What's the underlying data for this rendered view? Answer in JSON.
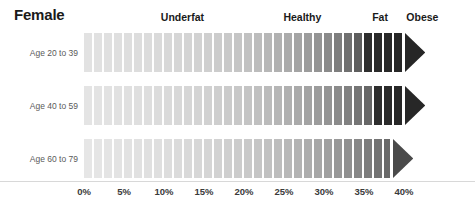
{
  "title": "Female",
  "categories": [
    {
      "label": "Underfat",
      "center_pct": 12.3
    },
    {
      "label": "Healthy",
      "center_pct": 27.3
    },
    {
      "label": "Fat",
      "center_pct": 37.0
    },
    {
      "label": "Obese",
      "center_pct": 42.3
    }
  ],
  "axis": {
    "ticks": [
      "0%",
      "5%",
      "10%",
      "15%",
      "20%",
      "25%",
      "30%",
      "35%",
      "40%"
    ],
    "tick_values": [
      0,
      5,
      10,
      15,
      20,
      25,
      30,
      35,
      40
    ],
    "min": 0,
    "max": 40,
    "px_per_pct": 8.0,
    "origin_x": 84
  },
  "rows": [
    {
      "label": "Age 20 to 39",
      "top": 33,
      "height": 39,
      "end_pct": 40.0
    },
    {
      "label": "Age 40 to 59",
      "top": 86,
      "height": 39,
      "end_pct": 40.0
    },
    {
      "label": "Age 60 to 79",
      "top": 139,
      "height": 39,
      "end_pct": 38.5
    }
  ],
  "colors": {
    "text_dark": "#1a1a1a",
    "text_muted": "#5a5a5a",
    "tick": "#3a3a3a",
    "background": "#ffffff",
    "gap": "#ffffff",
    "baseline": "#d8d8d8"
  },
  "chart_data": {
    "type": "bar",
    "title": "Female",
    "xlabel": "Body fat percentage",
    "ylabel": "",
    "xlim": [
      0,
      44
    ],
    "grid": false,
    "legend": "top",
    "categories": [
      "Age 20 to 39",
      "Age 40 to 59",
      "Age 60 to 79"
    ],
    "tick_labels": [
      "0%",
      "5%",
      "10%",
      "15%",
      "20%",
      "25%",
      "30%",
      "35%",
      "40%"
    ],
    "zone_labels": [
      "Underfat",
      "Healthy",
      "Fat",
      "Obese"
    ],
    "series": [
      {
        "name": "Age 20 to 39",
        "end_value": 40.0,
        "segments": [
          {
            "start": 0.0,
            "end": 1.25,
            "color": "#e2e2e2"
          },
          {
            "start": 1.25,
            "end": 2.5,
            "color": "#e1e1e1"
          },
          {
            "start": 2.5,
            "end": 3.75,
            "color": "#e0e0e0"
          },
          {
            "start": 3.75,
            "end": 5.0,
            "color": "#dfdfdf"
          },
          {
            "start": 5.0,
            "end": 6.25,
            "color": "#dedede"
          },
          {
            "start": 6.25,
            "end": 7.5,
            "color": "#dddddd"
          },
          {
            "start": 7.5,
            "end": 8.75,
            "color": "#dcdcdc"
          },
          {
            "start": 8.75,
            "end": 10.0,
            "color": "#dadada"
          },
          {
            "start": 10.0,
            "end": 11.25,
            "color": "#d8d8d8"
          },
          {
            "start": 11.25,
            "end": 12.5,
            "color": "#d6d6d6"
          },
          {
            "start": 12.5,
            "end": 13.75,
            "color": "#d4d4d4"
          },
          {
            "start": 13.75,
            "end": 15.0,
            "color": "#d2d2d2"
          },
          {
            "start": 15.0,
            "end": 16.25,
            "color": "#cfcfcf"
          },
          {
            "start": 16.25,
            "end": 17.5,
            "color": "#cccccc"
          },
          {
            "start": 17.5,
            "end": 18.75,
            "color": "#c9c9c9"
          },
          {
            "start": 18.75,
            "end": 20.0,
            "color": "#c5c5c5"
          },
          {
            "start": 20.0,
            "end": 21.25,
            "color": "#c1c1c1"
          },
          {
            "start": 21.25,
            "end": 22.5,
            "color": "#bcbcbc"
          },
          {
            "start": 22.5,
            "end": 23.75,
            "color": "#b7b7b7"
          },
          {
            "start": 23.75,
            "end": 25.0,
            "color": "#b1b1b1"
          },
          {
            "start": 25.0,
            "end": 26.25,
            "color": "#ababab"
          },
          {
            "start": 26.25,
            "end": 27.5,
            "color": "#a4a4a4"
          },
          {
            "start": 27.5,
            "end": 28.75,
            "color": "#9c9c9c"
          },
          {
            "start": 28.75,
            "end": 30.0,
            "color": "#949494"
          },
          {
            "start": 30.0,
            "end": 31.25,
            "color": "#8a8a8a"
          },
          {
            "start": 31.25,
            "end": 32.5,
            "color": "#7e7e7e"
          },
          {
            "start": 32.5,
            "end": 33.75,
            "color": "#707070"
          },
          {
            "start": 33.75,
            "end": 35.0,
            "color": "#5e5e5e"
          },
          {
            "start": 35.0,
            "end": 36.25,
            "color": "#2e2e2e"
          },
          {
            "start": 36.25,
            "end": 37.5,
            "color": "#2a2a2a"
          },
          {
            "start": 37.5,
            "end": 38.75,
            "color": "#282828"
          },
          {
            "start": 38.75,
            "end": 40.0,
            "color": "#262626"
          }
        ],
        "arrow_color": "#262626"
      },
      {
        "name": "Age 40 to 59",
        "end_value": 40.0,
        "segments": [
          {
            "start": 0.0,
            "end": 1.25,
            "color": "#e4e4e4"
          },
          {
            "start": 1.25,
            "end": 2.5,
            "color": "#e3e3e3"
          },
          {
            "start": 2.5,
            "end": 3.75,
            "color": "#e2e2e2"
          },
          {
            "start": 3.75,
            "end": 5.0,
            "color": "#e1e1e1"
          },
          {
            "start": 5.0,
            "end": 6.25,
            "color": "#e0e0e0"
          },
          {
            "start": 6.25,
            "end": 7.5,
            "color": "#dfdfdf"
          },
          {
            "start": 7.5,
            "end": 8.75,
            "color": "#dedede"
          },
          {
            "start": 8.75,
            "end": 10.0,
            "color": "#dcdcdc"
          },
          {
            "start": 10.0,
            "end": 11.25,
            "color": "#dadada"
          },
          {
            "start": 11.25,
            "end": 12.5,
            "color": "#d8d8d8"
          },
          {
            "start": 12.5,
            "end": 13.75,
            "color": "#d6d6d6"
          },
          {
            "start": 13.75,
            "end": 15.0,
            "color": "#d4d4d4"
          },
          {
            "start": 15.0,
            "end": 16.25,
            "color": "#d1d1d1"
          },
          {
            "start": 16.25,
            "end": 17.5,
            "color": "#cecece"
          },
          {
            "start": 17.5,
            "end": 18.75,
            "color": "#cbcbcb"
          },
          {
            "start": 18.75,
            "end": 20.0,
            "color": "#c8c8c8"
          },
          {
            "start": 20.0,
            "end": 21.25,
            "color": "#c4c4c4"
          },
          {
            "start": 21.25,
            "end": 22.5,
            "color": "#c0c0c0"
          },
          {
            "start": 22.5,
            "end": 23.75,
            "color": "#bbbbbb"
          },
          {
            "start": 23.75,
            "end": 25.0,
            "color": "#b6b6b6"
          },
          {
            "start": 25.0,
            "end": 26.25,
            "color": "#b0b0b0"
          },
          {
            "start": 26.25,
            "end": 27.5,
            "color": "#aaaaaa"
          },
          {
            "start": 27.5,
            "end": 28.75,
            "color": "#a3a3a3"
          },
          {
            "start": 28.75,
            "end": 30.0,
            "color": "#9c9c9c"
          },
          {
            "start": 30.0,
            "end": 31.25,
            "color": "#949494"
          },
          {
            "start": 31.25,
            "end": 32.5,
            "color": "#8b8b8b"
          },
          {
            "start": 32.5,
            "end": 33.75,
            "color": "#818181"
          },
          {
            "start": 33.75,
            "end": 35.0,
            "color": "#757575"
          },
          {
            "start": 35.0,
            "end": 36.25,
            "color": "#676767"
          },
          {
            "start": 36.25,
            "end": 37.5,
            "color": "#2e2e2e"
          },
          {
            "start": 37.5,
            "end": 38.75,
            "color": "#2a2a2a"
          },
          {
            "start": 38.75,
            "end": 40.0,
            "color": "#272727"
          }
        ],
        "arrow_color": "#272727"
      },
      {
        "name": "Age 60 to 79",
        "end_value": 38.5,
        "segments": [
          {
            "start": 0.0,
            "end": 1.25,
            "color": "#e6e6e6"
          },
          {
            "start": 1.25,
            "end": 2.5,
            "color": "#e5e5e5"
          },
          {
            "start": 2.5,
            "end": 3.75,
            "color": "#e4e4e4"
          },
          {
            "start": 3.75,
            "end": 5.0,
            "color": "#e3e3e3"
          },
          {
            "start": 5.0,
            "end": 6.25,
            "color": "#e2e2e2"
          },
          {
            "start": 6.25,
            "end": 7.5,
            "color": "#e1e1e1"
          },
          {
            "start": 7.5,
            "end": 8.75,
            "color": "#e0e0e0"
          },
          {
            "start": 8.75,
            "end": 10.0,
            "color": "#dfdfdf"
          },
          {
            "start": 10.0,
            "end": 11.25,
            "color": "#dddddd"
          },
          {
            "start": 11.25,
            "end": 12.5,
            "color": "#dbdbdb"
          },
          {
            "start": 12.5,
            "end": 13.75,
            "color": "#d9d9d9"
          },
          {
            "start": 13.75,
            "end": 15.0,
            "color": "#d7d7d7"
          },
          {
            "start": 15.0,
            "end": 16.25,
            "color": "#d5d5d5"
          },
          {
            "start": 16.25,
            "end": 17.5,
            "color": "#d2d2d2"
          },
          {
            "start": 17.5,
            "end": 18.75,
            "color": "#cfcfcf"
          },
          {
            "start": 18.75,
            "end": 20.0,
            "color": "#cccccc"
          },
          {
            "start": 20.0,
            "end": 21.25,
            "color": "#c9c9c9"
          },
          {
            "start": 21.25,
            "end": 22.5,
            "color": "#c5c5c5"
          },
          {
            "start": 22.5,
            "end": 23.75,
            "color": "#c1c1c1"
          },
          {
            "start": 23.75,
            "end": 25.0,
            "color": "#bdbdbd"
          },
          {
            "start": 25.0,
            "end": 26.25,
            "color": "#b8b8b8"
          },
          {
            "start": 26.25,
            "end": 27.5,
            "color": "#b3b3b3"
          },
          {
            "start": 27.5,
            "end": 28.75,
            "color": "#adadad"
          },
          {
            "start": 28.75,
            "end": 30.0,
            "color": "#a7a7a7"
          },
          {
            "start": 30.0,
            "end": 31.25,
            "color": "#a0a0a0"
          },
          {
            "start": 31.25,
            "end": 32.5,
            "color": "#989898"
          },
          {
            "start": 32.5,
            "end": 33.75,
            "color": "#909090"
          },
          {
            "start": 33.75,
            "end": 35.0,
            "color": "#878787"
          },
          {
            "start": 35.0,
            "end": 36.25,
            "color": "#7d7d7d"
          },
          {
            "start": 36.25,
            "end": 37.5,
            "color": "#737373"
          },
          {
            "start": 37.5,
            "end": 38.5,
            "color": "#6a6a6a"
          }
        ],
        "arrow_color": "#4a4a4a"
      }
    ]
  }
}
